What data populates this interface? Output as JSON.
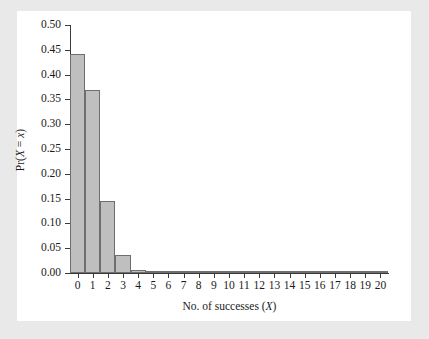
{
  "figure": {
    "background_color": "#e9e9e9",
    "panel_color": "#ffffff",
    "bar_fill": "#bfbfbf",
    "bar_edge": "#6e6e6e",
    "axis_color": "#3a3a3a"
  },
  "axis": {
    "xlabel_prefix": "No. of successes (",
    "xlabel_var": "X",
    "xlabel_suffix": ")",
    "ylabel_prefix": "Pr(",
    "ylabel_var1": "X",
    "ylabel_mid": " = ",
    "ylabel_var2": "x",
    "ylabel_suffix": ")"
  },
  "chart_data": {
    "type": "bar",
    "title": "",
    "xlabel": "No. of successes (X)",
    "ylabel": "Pr(X = x)",
    "categories": [
      0,
      1,
      2,
      3,
      4,
      5,
      6,
      7,
      8,
      9,
      10,
      11,
      12,
      13,
      14,
      15,
      16,
      17,
      18,
      19,
      20
    ],
    "xtick_labels": [
      "0",
      "1",
      "2",
      "3",
      "4",
      "5",
      "6",
      "7",
      "8",
      "9",
      "10",
      "11",
      "12",
      "13",
      "14",
      "15",
      "16",
      "17",
      "18",
      "19",
      "20"
    ],
    "values": [
      0.442,
      0.368,
      0.146,
      0.036,
      0.006,
      0.001,
      0.0,
      0.0,
      0.0,
      0.0,
      0.0,
      0.0,
      0.0,
      0.0,
      0.0,
      0.0,
      0.0,
      0.0,
      0.0,
      0.0,
      0.0
    ],
    "ytick_values": [
      0.0,
      0.05,
      0.1,
      0.15,
      0.2,
      0.25,
      0.3,
      0.35,
      0.4,
      0.45,
      0.5
    ],
    "ytick_labels": [
      "0.00",
      "0.05",
      "0.10",
      "0.15",
      "0.20",
      "0.25",
      "0.30",
      "0.35",
      "0.40",
      "0.45",
      "0.50"
    ],
    "xlim": [
      -0.5,
      20.5
    ],
    "ylim": [
      0.0,
      0.5
    ],
    "grid": false,
    "legend": false,
    "bar_width": 1.0
  }
}
